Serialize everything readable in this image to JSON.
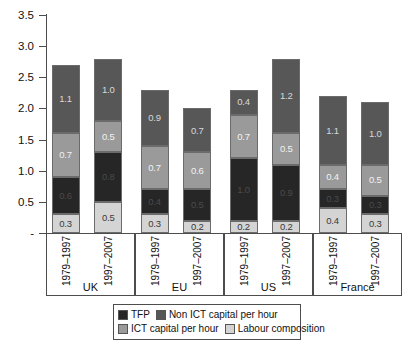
{
  "chart_data": {
    "type": "bar",
    "stacked": true,
    "title": "",
    "xlabel": "",
    "ylabel": "",
    "ylim": [
      0,
      3.5
    ],
    "yticks": [
      "-",
      "0.5",
      "1.0",
      "1.5",
      "2.0",
      "2.5",
      "3.0",
      "3.5"
    ],
    "ytick_values": [
      0,
      0.5,
      1.0,
      1.5,
      2.0,
      2.5,
      3.0,
      3.5
    ],
    "grid": false,
    "legend_position": "bottom",
    "groups": [
      "UK",
      "EU",
      "US",
      "France"
    ],
    "periods": [
      "1979–1997",
      "1997–2007"
    ],
    "categories": [
      "UK 1979–1997",
      "UK 1997–2007",
      "EU 1979–1997",
      "EU 1997–2007",
      "US 1979–1997",
      "US 1997–2007",
      "France 1979–1997",
      "France 1997–2007"
    ],
    "series": [
      {
        "name": "Labour composition",
        "color": "#d4d4d4",
        "values": [
          0.3,
          0.5,
          0.3,
          0.2,
          0.2,
          0.2,
          0.4,
          0.3
        ],
        "labels": [
          "0.3",
          "0.5",
          "0.3",
          "0.2",
          "0.2",
          "0.2",
          "0.4",
          "0.3"
        ]
      },
      {
        "name": "TFP",
        "color": "#262626",
        "values": [
          0.6,
          0.8,
          0.4,
          0.5,
          1.0,
          0.9,
          0.3,
          0.3
        ],
        "labels": [
          "0.6",
          "0.8",
          "0.4",
          "0.5",
          "1.0",
          "0.9",
          "0.3",
          "0.3"
        ]
      },
      {
        "name": "ICT capital per hour",
        "color": "#9a9a9a",
        "values": [
          0.7,
          0.5,
          0.7,
          0.6,
          0.7,
          0.5,
          0.4,
          0.5
        ],
        "labels": [
          "0.7",
          "0.5",
          "0.7",
          "0.6",
          "0.7",
          "0.5",
          "0.4",
          "0.5"
        ]
      },
      {
        "name": "Non ICT capital per hour",
        "color": "#575757",
        "values": [
          1.1,
          1.0,
          0.9,
          0.7,
          0.4,
          1.2,
          1.1,
          1.0
        ],
        "labels": [
          "1.1",
          "1.0",
          "0.9",
          "0.7",
          "0.4",
          "1.2",
          "1.1",
          "1.0"
        ]
      }
    ],
    "totals": [
      2.67,
      2.79,
      2.28,
      1.93,
      2.28,
      2.8,
      2.19,
      2.12
    ]
  },
  "legend": {
    "row1": [
      {
        "label": "TFP",
        "color": "#262626"
      },
      {
        "label": "Non ICT capital per hour",
        "color": "#575757"
      }
    ],
    "row2": [
      {
        "label": "ICT capital per hour",
        "color": "#9a9a9a"
      },
      {
        "label": "Labour composition",
        "color": "#d4d4d4"
      }
    ]
  },
  "axis": {
    "ytick_0": "-",
    "ytick_1": "0.5",
    "ytick_2": "1.0",
    "ytick_3": "1.5",
    "ytick_4": "2.0",
    "ytick_5": "2.5",
    "ytick_6": "3.0",
    "ytick_7": "3.5"
  }
}
